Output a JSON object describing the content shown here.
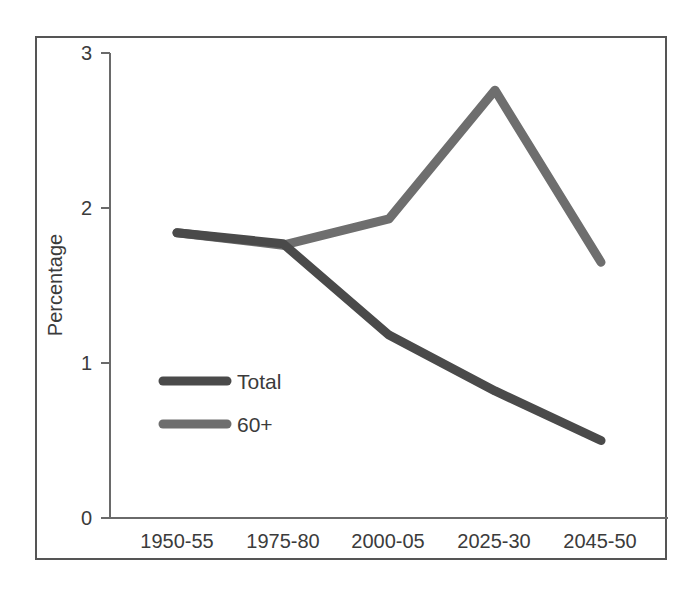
{
  "chart_data": {
    "type": "line",
    "title": "",
    "xlabel": "",
    "ylabel": "Percentage",
    "categories": [
      "1950-55",
      "1975-80",
      "2000-05",
      "2025-30",
      "2045-50"
    ],
    "series": [
      {
        "name": "Total",
        "values": [
          1.84,
          1.77,
          1.18,
          0.82,
          0.5
        ],
        "color": "#4a4a4a"
      },
      {
        "name": "60+",
        "values": [
          1.84,
          1.76,
          1.93,
          2.76,
          1.65
        ],
        "color": "#6e6e6e"
      }
    ],
    "ylim": [
      0,
      3
    ],
    "yticks": [
      0,
      1,
      2,
      3
    ],
    "ytick_labels": [
      "0",
      "1",
      "2",
      "3"
    ],
    "grid": false,
    "legend_position": "inside-left-middle"
  },
  "axes": {
    "y_title": "Percentage",
    "y_ticks": [
      {
        "value": "3"
      },
      {
        "value": "2"
      },
      {
        "value": "1"
      },
      {
        "value": "0"
      }
    ],
    "x_ticks": [
      {
        "label": "1950-55"
      },
      {
        "label": "1975-80"
      },
      {
        "label": "2000-05"
      },
      {
        "label": "2025-30"
      },
      {
        "label": "2045-50"
      }
    ]
  },
  "legend": {
    "entries": [
      {
        "label": "Total"
      },
      {
        "label": "60+"
      }
    ]
  },
  "colors": {
    "total_line": "#4a4a4a",
    "sixty_plus_line": "#6e6e6e",
    "axis": "#6a6a6a",
    "frame": "#555555",
    "text": "#3b3b3b",
    "background": "#ffffff"
  }
}
